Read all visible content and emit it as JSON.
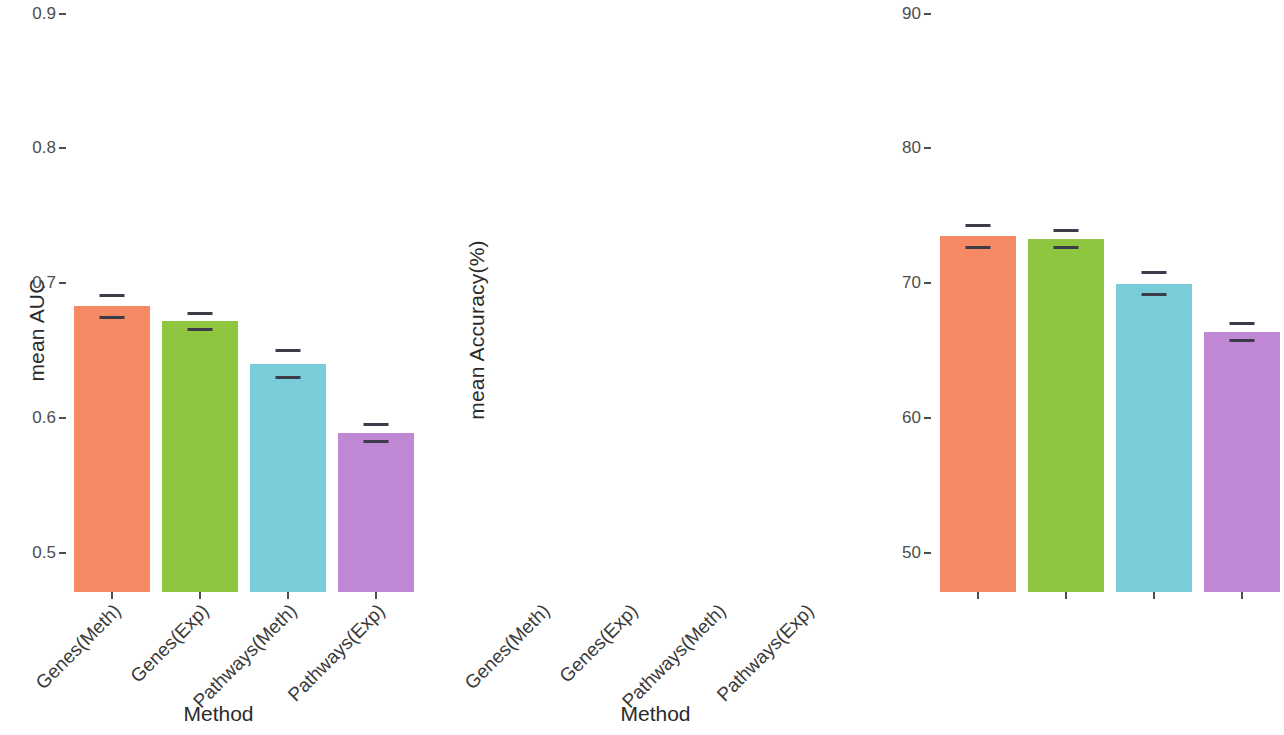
{
  "chart_data": [
    {
      "type": "bar",
      "panel": "left",
      "title": "",
      "xlabel": "Method",
      "ylabel": "mean AUC",
      "categories": [
        "Genes(Meth)",
        "Genes(Exp)",
        "Pathways(Meth)",
        "Pathways(Exp)"
      ],
      "values": [
        0.717,
        0.728,
        0.76,
        0.811
      ],
      "errors": [
        0.008,
        0.006,
        0.01,
        0.006
      ],
      "ylim": [
        0.46,
        0.91
      ],
      "yticks": [
        "0.5",
        "0.6",
        "0.7",
        "0.8",
        "0.9"
      ],
      "ytick_values": [
        0.5,
        0.6,
        0.7,
        0.8,
        0.9
      ],
      "colors": [
        "#f58a65",
        "#8ec63f",
        "#79cdd8",
        "#bf87d4"
      ],
      "grid": false,
      "legend": "none"
    },
    {
      "type": "bar",
      "panel": "right",
      "title": "",
      "xlabel": "Method",
      "ylabel": "mean Accuracy(%)",
      "categories": [
        "Genes(Meth)",
        "Genes(Exp)",
        "Pathways(Meth)",
        "Pathways(Exp)"
      ],
      "values": [
        66.5,
        66.7,
        70.0,
        73.6
      ],
      "errors": [
        0.8,
        0.6,
        0.8,
        0.6
      ],
      "ylim": [
        45.5,
        91.0
      ],
      "yticks": [
        "50",
        "60",
        "70",
        "80",
        "90"
      ],
      "ytick_values": [
        50,
        60,
        70,
        80,
        90
      ],
      "colors": [
        "#f58a65",
        "#8ec63f",
        "#79cdd8",
        "#bf87d4"
      ],
      "grid": false,
      "legend": "none"
    }
  ],
  "left_panel": {
    "ylabel": "mean AUC",
    "xtitle": "Method",
    "yticks": [
      "0.9",
      "0.8",
      "0.7",
      "0.6",
      "0.5"
    ],
    "xlabels": [
      "Genes(Meth)",
      "Genes(Exp)",
      "Pathways(Meth)",
      "Pathways(Exp)"
    ]
  },
  "right_panel": {
    "ylabel": "mean Accuracy(%)",
    "xtitle": "Method",
    "yticks": [
      "90",
      "80",
      "70",
      "60",
      "50"
    ],
    "xlabels": [
      "Genes(Meth)",
      "Genes(Exp)",
      "Pathways(Meth)",
      "Pathways(Exp)"
    ]
  },
  "colors": {
    "bar1": "#f58a65",
    "bar2": "#8ec63f",
    "bar3": "#79cdd8",
    "bar4": "#bf87d4",
    "errorbar": "#3b3b4a",
    "axis_text": "#4d4d4d",
    "label_text": "#2b2b2b"
  }
}
